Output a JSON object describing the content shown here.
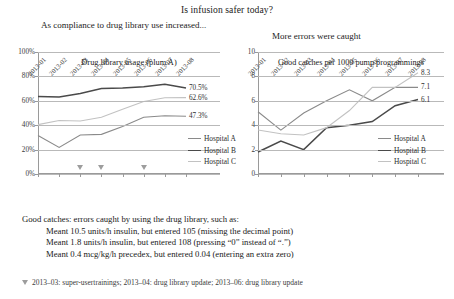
{
  "header": {
    "title": "Is infusion safer today?"
  },
  "captions": {
    "left": "As compliance to drug library use increased...",
    "right": "More errors were caught"
  },
  "legend": {
    "items": [
      {
        "label": "Hospital A",
        "color": "#8a8a8a"
      },
      {
        "label": "Hospital B",
        "color": "#4a4a4a"
      },
      {
        "label": "Hospital C",
        "color": "#c2c2c2"
      }
    ]
  },
  "notes": {
    "intro": "Good catches: errors caught by using the drug library, such as:",
    "lines": [
      "Meant 10.5 units/h insulin, but entered 105 (missing the decimal point)",
      "Meant 1.8 units/h insulin, but entered 108 (pressing “0” instead of “.”)",
      "Meant 0.4 mcg/kg/h precedex, but entered 0.04 (entering an extra zero)"
    ],
    "footnote": "2013–03: super-usertrainings; 2013–04: drug library update; 2013–06: drug library update"
  },
  "chart_data": [
    {
      "id": "left",
      "type": "line",
      "title": "Drug library usage (plum A)",
      "xlabel": "",
      "ylabel": "",
      "ylim": [
        0,
        100
      ],
      "yticks": [
        "0%",
        "20%",
        "40%",
        "60%",
        "80%",
        "100%"
      ],
      "ytick_values": [
        0,
        20,
        40,
        60,
        80,
        100
      ],
      "grid": true,
      "legend_position": "right",
      "categories": [
        "2013-01",
        "2013-02",
        "2013-03",
        "2013-04",
        "2013-05",
        "2013-06",
        "2013-07",
        "2013-08"
      ],
      "series": [
        {
          "name": "Hospital A",
          "color": "#8a8a8a",
          "values": [
            31.5,
            21.8,
            32.0,
            32.5,
            39.0,
            46.5,
            47.8,
            47.3
          ],
          "end_label": "47.3%"
        },
        {
          "name": "Hospital B",
          "color": "#4a4a4a",
          "values": [
            63.5,
            63.2,
            66.0,
            70.0,
            70.5,
            71.5,
            73.5,
            70.5
          ],
          "end_label": "70.5%"
        },
        {
          "name": "Hospital C",
          "color": "#c2c2c2",
          "values": [
            40.5,
            43.8,
            43.5,
            46.5,
            53.0,
            59.5,
            62.5,
            62.6
          ],
          "end_label": "62.6%"
        }
      ],
      "annotations": [
        {
          "marker": "triangle",
          "at": "2013-03"
        },
        {
          "marker": "triangle",
          "at": "2013-04"
        },
        {
          "marker": "triangle",
          "at": "2013-06"
        }
      ]
    },
    {
      "id": "right",
      "type": "line",
      "title": "Good catches per 1000 pump programmings",
      "xlabel": "",
      "ylabel": "",
      "ylim": [
        0,
        10
      ],
      "yticks": [
        "0",
        "2",
        "4",
        "6",
        "8",
        "10"
      ],
      "ytick_values": [
        0,
        2,
        4,
        6,
        8,
        10
      ],
      "grid": true,
      "legend_position": "right",
      "categories": [
        "2013-01",
        "2013-02",
        "2013-03",
        "2013-04",
        "2013-05",
        "2013-06",
        "2013-07",
        "2013-08"
      ],
      "series": [
        {
          "name": "Hospital A",
          "color": "#8a8a8a",
          "values": [
            5.1,
            3.6,
            5.0,
            6.0,
            6.9,
            6.0,
            7.1,
            7.1
          ],
          "end_label": "7.1"
        },
        {
          "name": "Hospital B",
          "color": "#4a4a4a",
          "values": [
            1.8,
            2.7,
            2.0,
            3.8,
            4.0,
            4.3,
            5.6,
            6.1
          ],
          "end_label": "6.1"
        },
        {
          "name": "Hospital C",
          "color": "#c2c2c2",
          "values": [
            3.6,
            3.3,
            3.2,
            3.8,
            5.2,
            7.1,
            7.1,
            8.3
          ],
          "end_label": "8.3"
        }
      ],
      "annotations": []
    }
  ]
}
